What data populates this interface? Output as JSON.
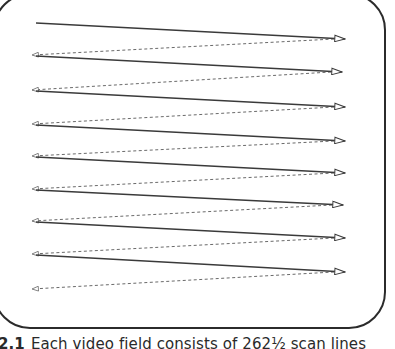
{
  "figure": {
    "frame": {
      "x": -6,
      "y": -6,
      "width": 391,
      "height": 334,
      "radius": 36,
      "stroke": "#2b2b2b"
    },
    "colors": {
      "scan": "#3a3a3a",
      "retrace": "#6a6a6a"
    },
    "scan_lines": [
      {
        "x1": 36,
        "y1": 23,
        "x2": 345,
        "y2": 39
      },
      {
        "x1": 36,
        "y1": 56,
        "x2": 342,
        "y2": 72
      },
      {
        "x1": 36,
        "y1": 91,
        "x2": 345,
        "y2": 107
      },
      {
        "x1": 36,
        "y1": 125,
        "x2": 345,
        "y2": 141
      },
      {
        "x1": 36,
        "y1": 157,
        "x2": 345,
        "y2": 173
      },
      {
        "x1": 36,
        "y1": 190,
        "x2": 343,
        "y2": 205
      },
      {
        "x1": 36,
        "y1": 222,
        "x2": 345,
        "y2": 238
      },
      {
        "x1": 36,
        "y1": 255,
        "x2": 345,
        "y2": 272
      }
    ],
    "retrace_lines": [
      {
        "x1": 334,
        "y1": 39,
        "x2": 32,
        "y2": 55
      },
      {
        "x1": 331,
        "y1": 72,
        "x2": 32,
        "y2": 90
      },
      {
        "x1": 334,
        "y1": 107,
        "x2": 32,
        "y2": 124
      },
      {
        "x1": 334,
        "y1": 141,
        "x2": 32,
        "y2": 156
      },
      {
        "x1": 334,
        "y1": 173,
        "x2": 32,
        "y2": 189
      },
      {
        "x1": 332,
        "y1": 205,
        "x2": 32,
        "y2": 221
      },
      {
        "x1": 334,
        "y1": 238,
        "x2": 32,
        "y2": 254
      },
      {
        "x1": 334,
        "y1": 272,
        "x2": 32,
        "y2": 289
      }
    ]
  },
  "caption": {
    "number": "2.1",
    "text": "Each video field consists of 262½ scan lines"
  }
}
